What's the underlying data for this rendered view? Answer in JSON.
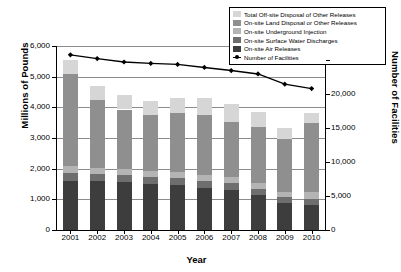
{
  "chart_data": {
    "type": "bar",
    "title": "",
    "subtitle": "",
    "xlabel": "Year",
    "ylabel": "Millions of Pounds",
    "ylabel_right": "Number of Facilities",
    "categories": [
      "2001",
      "2002",
      "2003",
      "2004",
      "2005",
      "2006",
      "2007",
      "2008",
      "2009",
      "2010"
    ],
    "ylim": [
      0,
      6000
    ],
    "ylim_right": [
      0,
      25000
    ],
    "yticks": [
      "0",
      "1,000",
      "2,000",
      "3,000",
      "4,000",
      "5,000",
      "6,000"
    ],
    "yticks_right": [
      "0",
      "5,000",
      "10,000",
      "15,000",
      "20,000",
      "25,000"
    ],
    "grid": true,
    "legend_position": "top-right",
    "stacked": true,
    "series": [
      {
        "name": "On-site Air Releases",
        "color": "#3d3d3d",
        "values": [
          1610,
          1600,
          1570,
          1500,
          1470,
          1370,
          1310,
          1150,
          890,
          800
        ]
      },
      {
        "name": "On-site Surface Water Discharges",
        "color": "#6e6e6e",
        "values": [
          255,
          230,
          225,
          230,
          225,
          230,
          225,
          195,
          175,
          200
        ]
      },
      {
        "name": "On-site Underground Injection",
        "color": "#b4b4b4",
        "values": [
          225,
          200,
          195,
          200,
          200,
          200,
          205,
          200,
          190,
          250
        ]
      },
      {
        "name": "On-site Land Disposal or Other Releases",
        "color": "#8f8f8f",
        "values": [
          3010,
          2210,
          1940,
          1820,
          1920,
          1960,
          1790,
          1810,
          1720,
          2240
        ]
      },
      {
        "name": "Total Off-site Disposal of Other Releases",
        "color": "#d6d6d6",
        "values": [
          440,
          470,
          480,
          460,
          490,
          540,
          580,
          480,
          360,
          330
        ]
      }
    ],
    "line_series": {
      "name": "Number of Facilities",
      "color": "#000000",
      "marker": "diamond",
      "axis": "right",
      "values": [
        25700,
        25150,
        24650,
        24450,
        24300,
        23850,
        23400,
        22900,
        21400,
        20750
      ]
    }
  },
  "legend": {
    "items": [
      {
        "label": "Total Off-site Disposal of Other Releases",
        "swatch": "#d6d6d6",
        "kind": "swatch"
      },
      {
        "label": "On-site Land Disposal or Other Releases",
        "swatch": "#8f8f8f",
        "kind": "swatch"
      },
      {
        "label": "On-site Underground Injection",
        "swatch": "#b4b4b4",
        "kind": "swatch"
      },
      {
        "label": "On-site Surface Water Discharges",
        "swatch": "#6e6e6e",
        "kind": "swatch"
      },
      {
        "label": "On-site Air Releases",
        "swatch": "#3d3d3d",
        "kind": "swatch"
      },
      {
        "label": "Number of Facilities",
        "swatch": "#000000",
        "kind": "line-marker"
      }
    ]
  }
}
